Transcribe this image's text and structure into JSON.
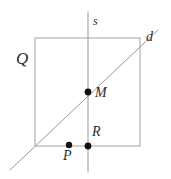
{
  "figure": {
    "kind": "plane-geometry-diagram",
    "canvas": {
      "width": 171,
      "height": 179,
      "background": "#ffffff"
    },
    "style": {
      "line_color": "#9a9a9a",
      "square_color": "#a2a2a2",
      "point_color": "#111111",
      "label_color": "#2b2b2b",
      "line_width": 1,
      "point_radius": 3.2
    },
    "square": {
      "name": "Q",
      "x": 35,
      "y": 38,
      "width": 105,
      "height": 108
    },
    "lines": [
      {
        "name": "s",
        "role": "vertical-line",
        "x1": 88,
        "y1": 12,
        "x2": 88,
        "y2": 172
      },
      {
        "name": "d",
        "role": "diagonal-line",
        "x1": 10,
        "y1": 170,
        "x2": 158,
        "y2": 30
      }
    ],
    "points": [
      {
        "name": "M",
        "x": 88,
        "y": 92,
        "note": "intersection of s and d"
      },
      {
        "name": "R",
        "x": 88,
        "y": 146,
        "note": "s meets bottom edge of Q"
      },
      {
        "name": "P",
        "x": 69,
        "y": 145,
        "note": "point on bottom edge of Q"
      }
    ],
    "labels": {
      "square": "Q",
      "vertical_line": "s",
      "diagonal_line": "d",
      "point_m": "M",
      "point_r": "R",
      "point_p": "P"
    }
  }
}
